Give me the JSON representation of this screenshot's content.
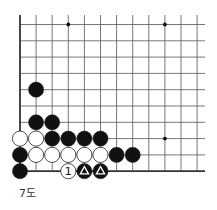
{
  "diagram": {
    "caption": "7도",
    "board": {
      "origin_x": 20,
      "origin_y": 24.5,
      "spacing_x": 16.1,
      "spacing_y": 16.3,
      "columns": 12,
      "rows": 10,
      "right_extent": 205,
      "top_extent": 15,
      "edges": [
        "left",
        "bottom"
      ],
      "line_color": "#555555",
      "edge_color": "#333333"
    },
    "hoshi": [
      {
        "col": 3,
        "row": 0
      },
      {
        "col": 9,
        "row": 0
      },
      {
        "col": 3,
        "row": 7
      },
      {
        "col": 9,
        "row": 7
      }
    ],
    "stones": [
      {
        "color": "black",
        "col": 1,
        "row": 4
      },
      {
        "color": "black",
        "col": 1,
        "row": 6
      },
      {
        "color": "black",
        "col": 2,
        "row": 6
      },
      {
        "color": "white",
        "col": 0,
        "row": 7
      },
      {
        "color": "white",
        "col": 1,
        "row": 7
      },
      {
        "color": "black",
        "col": 2,
        "row": 7
      },
      {
        "color": "black",
        "col": 3,
        "row": 7
      },
      {
        "color": "black",
        "col": 4,
        "row": 7
      },
      {
        "color": "black",
        "col": 5,
        "row": 7
      },
      {
        "color": "black",
        "col": 0,
        "row": 8
      },
      {
        "color": "white",
        "col": 1,
        "row": 8
      },
      {
        "color": "white",
        "col": 2,
        "row": 8
      },
      {
        "color": "white",
        "col": 3,
        "row": 8
      },
      {
        "color": "white",
        "col": 4,
        "row": 8
      },
      {
        "color": "white",
        "col": 5,
        "row": 8
      },
      {
        "color": "black",
        "col": 6,
        "row": 8
      },
      {
        "color": "black",
        "col": 7,
        "row": 8
      },
      {
        "color": "black",
        "col": 0,
        "row": 9
      },
      {
        "color": "white",
        "col": 3,
        "row": 9,
        "label": "1"
      },
      {
        "color": "black",
        "col": 4,
        "row": 9,
        "mark": "triangle"
      },
      {
        "color": "black",
        "col": 5,
        "row": 9,
        "mark": "triangle"
      }
    ],
    "colors": {
      "black_stone": "#111111",
      "white_stone": "#ffffff",
      "stone_outline": "#222222"
    }
  }
}
